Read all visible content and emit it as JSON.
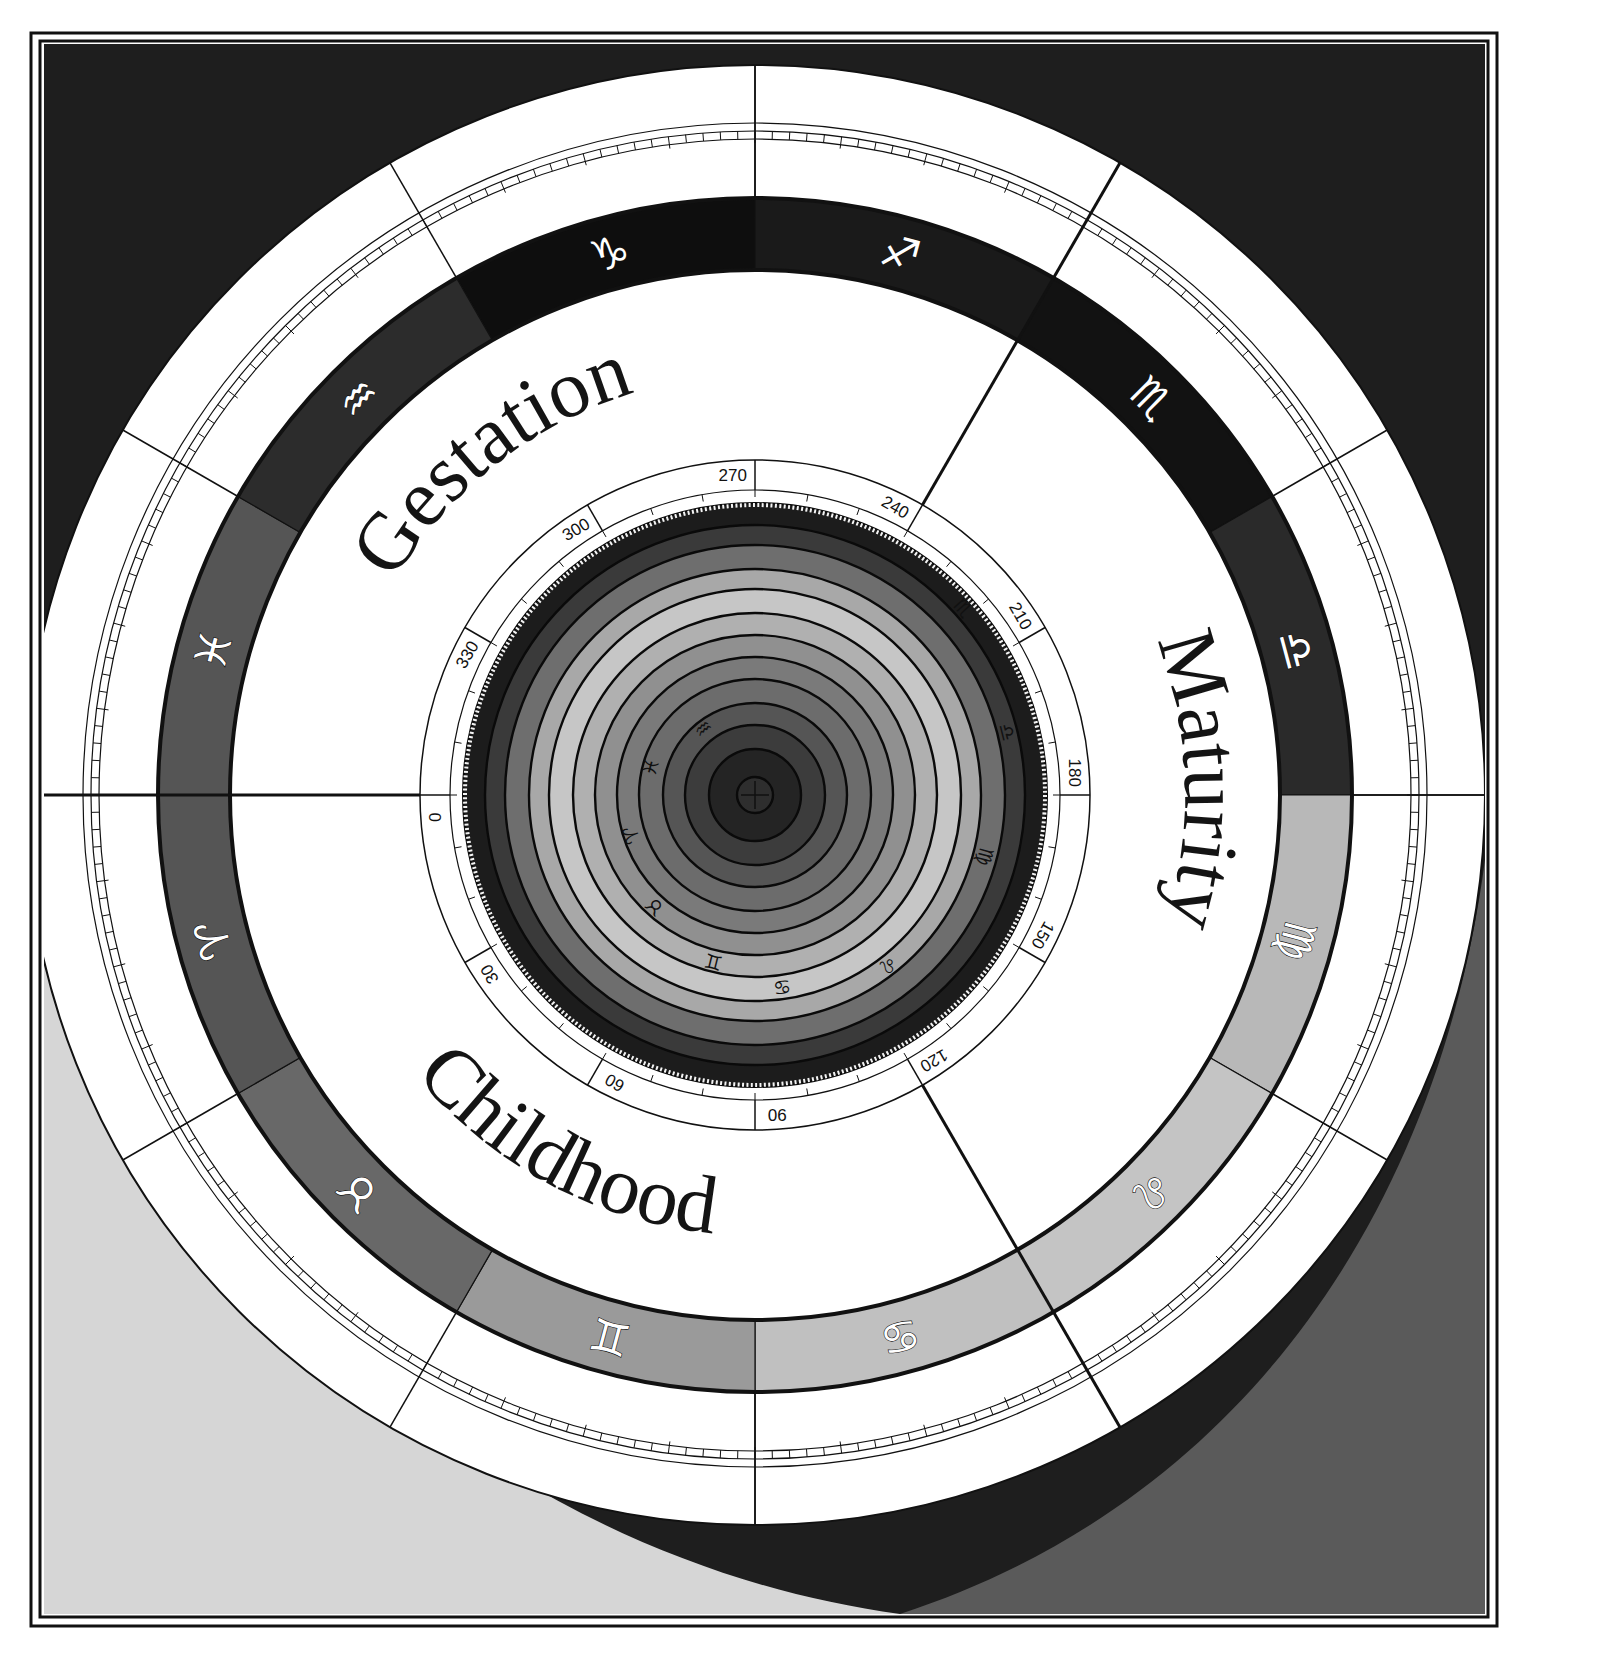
{
  "figure": {
    "center": [
      755,
      795
    ],
    "colors": {
      "background_top": "#1e1e1e",
      "background_lower_left": "#d6d6d6",
      "background_lower_right": "#5a5a5a",
      "ring_white": "#ffffff",
      "line": "#111111"
    }
  },
  "phases": [
    {
      "label": "Gestation",
      "angle": -128
    },
    {
      "label": "Maturity",
      "angle": -2
    },
    {
      "label": "Childhood",
      "angle": 118
    }
  ],
  "zodiac_ring": {
    "signs": [
      {
        "name": "Capricorn",
        "glyph": "♑",
        "center_angle": -105,
        "color": "#0e0e0e"
      },
      {
        "name": "Sagittarius",
        "glyph": "♐",
        "center_angle": -75,
        "color": "#1a1a1a"
      },
      {
        "name": "Scorpio",
        "glyph": "♏",
        "center_angle": -45,
        "color": "#121212"
      },
      {
        "name": "Libra",
        "glyph": "♎",
        "center_angle": -15,
        "color": "#2a2a2a"
      },
      {
        "name": "Virgo",
        "glyph": "♍",
        "center_angle": 15,
        "color": "#b8b8b8"
      },
      {
        "name": "Leo",
        "glyph": "♌",
        "center_angle": 45,
        "color": "#c4c4c4"
      },
      {
        "name": "Cancer",
        "glyph": "♋",
        "center_angle": 75,
        "color": "#c0c0c0"
      },
      {
        "name": "Gemini",
        "glyph": "♊",
        "center_angle": 105,
        "color": "#9a9a9a"
      },
      {
        "name": "Taurus",
        "glyph": "♉",
        "center_angle": 135,
        "color": "#686868"
      },
      {
        "name": "Aries",
        "glyph": "♈",
        "center_angle": 165,
        "color": "#555555"
      },
      {
        "name": "Pisces",
        "glyph": "♓",
        "center_angle": 195,
        "color": "#555555"
      },
      {
        "name": "Aquarius",
        "glyph": "♒",
        "center_angle": 225,
        "color": "#2c2c2c"
      }
    ]
  },
  "degree_scale": {
    "labels": [
      {
        "text": "0",
        "angle": 180
      },
      {
        "text": "30",
        "angle": 150
      },
      {
        "text": "60",
        "angle": 120
      },
      {
        "text": "90",
        "angle": 90
      },
      {
        "text": "120",
        "angle": 60
      },
      {
        "text": "150",
        "angle": 30
      },
      {
        "text": "180",
        "angle": 0
      },
      {
        "text": "210",
        "angle": -30
      },
      {
        "text": "240",
        "angle": -60
      },
      {
        "text": "270",
        "angle": -90
      },
      {
        "text": "300",
        "angle": -120
      },
      {
        "text": "330",
        "angle": -150
      }
    ]
  },
  "inner_disc": {
    "rings": [
      {
        "r": 292,
        "color": "#1c1c1c"
      },
      {
        "r": 270,
        "color": "#3a3a3a"
      },
      {
        "r": 250,
        "color": "#6e6e6e"
      },
      {
        "r": 226,
        "color": "#a8a8a8"
      },
      {
        "r": 206,
        "color": "#c6c6c6"
      },
      {
        "r": 182,
        "color": "#b0b0b0"
      },
      {
        "r": 160,
        "color": "#909090"
      },
      {
        "r": 138,
        "color": "#7a7a7a"
      },
      {
        "r": 116,
        "color": "#6c6c6c"
      },
      {
        "r": 92,
        "color": "#555555"
      },
      {
        "r": 70,
        "color": "#3c3c3c"
      },
      {
        "r": 46,
        "color": "#242424"
      },
      {
        "r": 18,
        "color": "#2e2e2e"
      }
    ],
    "glyphs": [
      {
        "glyph": "♒",
        "r": 84,
        "angle": -128
      },
      {
        "glyph": "♓",
        "r": 108,
        "angle": -165
      },
      {
        "glyph": "♈",
        "r": 130,
        "angle": 162
      },
      {
        "glyph": "♉",
        "r": 150,
        "angle": 132
      },
      {
        "glyph": "♊",
        "r": 172,
        "angle": 104
      },
      {
        "glyph": "♋",
        "r": 194,
        "angle": 82
      },
      {
        "glyph": "♌",
        "r": 216,
        "angle": 52
      },
      {
        "glyph": "♍",
        "r": 238,
        "angle": 15
      },
      {
        "glyph": "♎",
        "r": 260,
        "angle": -14
      },
      {
        "glyph": "♏",
        "r": 280,
        "angle": -42
      }
    ]
  }
}
